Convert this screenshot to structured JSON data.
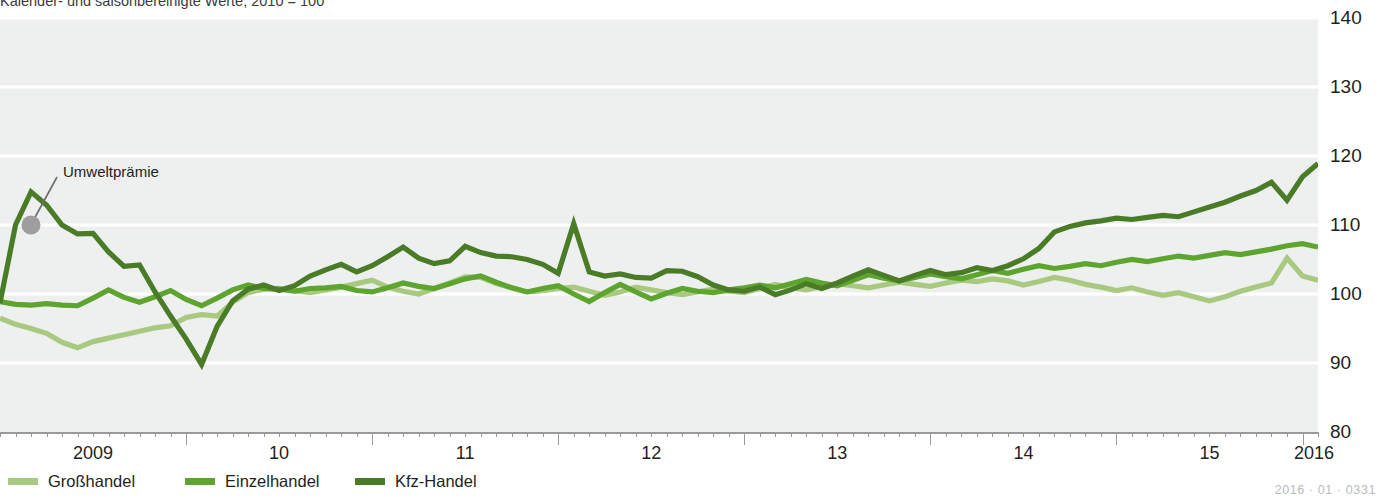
{
  "title": "Kalender- und saisonbereinigte Werte, 2010 = 100",
  "footer_code": "2016 · 01 · 0331",
  "annotation": {
    "label": "Umweltprämie",
    "marker_color": "#9e9e9e"
  },
  "legend": {
    "position": "bottom-left",
    "items": [
      {
        "label": "Großhandel",
        "color": "#a8c97f"
      },
      {
        "label": "Einzelhandel",
        "color": "#5da52f"
      },
      {
        "label": "Kfz-Handel",
        "color": "#4a7c28"
      }
    ]
  },
  "chart_data": {
    "type": "line",
    "title": "Kalender- und saisonbereinigte Werte, 2010 = 100",
    "xlabel": "",
    "ylabel": "",
    "ylim": [
      80,
      140
    ],
    "yticks": [
      80,
      90,
      100,
      110,
      120,
      130,
      140
    ],
    "xlim": [
      2009.0,
      2016.0833
    ],
    "xticks": [
      2009,
      2010,
      2011,
      2012,
      2013,
      2014,
      2015,
      2016
    ],
    "xticklabels": [
      "2009",
      "10",
      "11",
      "12",
      "13",
      "14",
      "15",
      "2016"
    ],
    "x_minor_tick_interval_months": 1,
    "grid": true,
    "grid_color": "#ffffff",
    "plot_background": "#eef0ef",
    "legend_position": "bottom-left",
    "annotations": [
      {
        "text": "Umweltprämie",
        "x": 2009.1667,
        "y": 110.0,
        "marker": true
      }
    ],
    "x": [
      2009.0,
      2009.0833,
      2009.1667,
      2009.25,
      2009.3333,
      2009.4167,
      2009.5,
      2009.5833,
      2009.6667,
      2009.75,
      2009.8333,
      2009.9167,
      2010.0,
      2010.0833,
      2010.1667,
      2010.25,
      2010.3333,
      2010.4167,
      2010.5,
      2010.5833,
      2010.6667,
      2010.75,
      2010.8333,
      2010.9167,
      2011.0,
      2011.0833,
      2011.1667,
      2011.25,
      2011.3333,
      2011.4167,
      2011.5,
      2011.5833,
      2011.6667,
      2011.75,
      2011.8333,
      2011.9167,
      2012.0,
      2012.0833,
      2012.1667,
      2012.25,
      2012.3333,
      2012.4167,
      2012.5,
      2012.5833,
      2012.6667,
      2012.75,
      2012.8333,
      2012.9167,
      2013.0,
      2013.0833,
      2013.1667,
      2013.25,
      2013.3333,
      2013.4167,
      2013.5,
      2013.5833,
      2013.6667,
      2013.75,
      2013.8333,
      2013.9167,
      2014.0,
      2014.0833,
      2014.1667,
      2014.25,
      2014.3333,
      2014.4167,
      2014.5,
      2014.5833,
      2014.6667,
      2014.75,
      2014.8333,
      2014.9167,
      2015.0,
      2015.0833,
      2015.1667,
      2015.25,
      2015.3333,
      2015.4167,
      2015.5,
      2015.5833,
      2015.6667,
      2015.75,
      2015.8333,
      2015.9167,
      2016.0,
      2016.0833
    ],
    "series": [
      {
        "name": "Großhandel",
        "color": "#a8c97f",
        "values": [
          96.5,
          95.6,
          95.0,
          94.3,
          93.0,
          92.2,
          93.1,
          93.6,
          94.1,
          94.6,
          95.1,
          95.4,
          96.6,
          97.0,
          96.8,
          98.8,
          100.2,
          100.7,
          100.8,
          100.5,
          100.2,
          100.6,
          101.0,
          101.5,
          102.0,
          101.0,
          100.4,
          100.0,
          100.8,
          101.6,
          102.5,
          102.4,
          101.5,
          100.9,
          100.3,
          100.5,
          100.8,
          101.0,
          100.4,
          99.8,
          100.3,
          101.0,
          100.6,
          100.2,
          99.9,
          100.3,
          100.7,
          100.4,
          100.2,
          100.8,
          101.4,
          100.9,
          100.6,
          101.1,
          101.5,
          101.2,
          100.9,
          101.3,
          101.7,
          101.4,
          101.1,
          101.6,
          102.0,
          101.8,
          102.2,
          101.9,
          101.3,
          101.8,
          102.4,
          102.0,
          101.4,
          101.0,
          100.5,
          100.9,
          100.3,
          99.8,
          100.2,
          99.6,
          99.0,
          99.6,
          100.4,
          101.0,
          101.6,
          105.2,
          102.6,
          102.0
        ]
      },
      {
        "name": "Einzelhandel",
        "color": "#5da52f",
        "values": [
          98.9,
          98.5,
          98.4,
          98.6,
          98.4,
          98.3,
          99.4,
          100.6,
          99.5,
          98.8,
          99.6,
          100.5,
          99.2,
          98.3,
          99.4,
          100.6,
          101.3,
          100.8,
          100.7,
          100.4,
          100.8,
          100.9,
          101.1,
          100.5,
          100.3,
          100.9,
          101.6,
          101.1,
          100.8,
          101.5,
          102.2,
          102.6,
          101.7,
          100.9,
          100.3,
          100.8,
          101.2,
          100.0,
          98.9,
          100.2,
          101.4,
          100.3,
          99.3,
          100.1,
          100.8,
          100.4,
          100.2,
          100.6,
          100.9,
          101.3,
          100.9,
          101.5,
          102.1,
          101.6,
          101.2,
          102.0,
          102.8,
          102.3,
          101.9,
          102.4,
          102.9,
          102.5,
          102.2,
          102.8,
          103.4,
          103.0,
          103.6,
          104.1,
          103.7,
          104.0,
          104.4,
          104.1,
          104.6,
          105.0,
          104.7,
          105.1,
          105.5,
          105.2,
          105.6,
          106.0,
          105.7,
          106.1,
          106.5,
          107.0,
          107.3,
          106.8
        ]
      },
      {
        "name": "Kfz-Handel",
        "color": "#4a7c28",
        "values": [
          98.7,
          110.0,
          114.8,
          112.9,
          110.0,
          108.7,
          108.8,
          106.1,
          104.0,
          104.2,
          100.3,
          96.8,
          93.5,
          89.8,
          95.3,
          99.0,
          100.7,
          101.3,
          100.5,
          101.2,
          102.6,
          103.5,
          104.3,
          103.2,
          104.1,
          105.4,
          106.8,
          105.2,
          104.4,
          104.8,
          106.9,
          106.0,
          105.5,
          105.4,
          105.0,
          104.3,
          103.0,
          110.2,
          103.2,
          102.6,
          102.9,
          102.4,
          102.3,
          103.4,
          103.3,
          102.5,
          101.3,
          100.6,
          100.4,
          101.0,
          99.9,
          100.6,
          101.5,
          100.8,
          101.6,
          102.6,
          103.5,
          102.7,
          101.9,
          102.7,
          103.4,
          102.8,
          103.1,
          103.8,
          103.4,
          104.1,
          105.1,
          106.6,
          109.0,
          109.8,
          110.3,
          110.6,
          111.0,
          110.8,
          111.1,
          111.4,
          111.2,
          111.9,
          112.6,
          113.3,
          114.2,
          115.0,
          116.2,
          113.6,
          117.0,
          118.9
        ]
      }
    ]
  }
}
